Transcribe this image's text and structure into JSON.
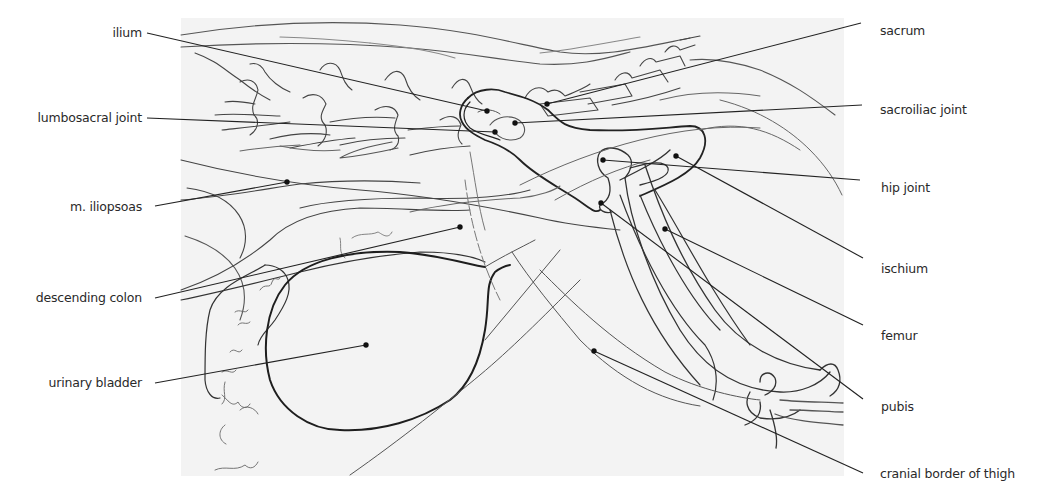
{
  "figure": {
    "background_panel_color": "#f3f3f3",
    "line_color": "#2b2b2b",
    "faint_line_color": "#6a6a6a"
  },
  "labels": {
    "left": [
      {
        "id": "ilium",
        "text": "ilium"
      },
      {
        "id": "lumbosacral-joint",
        "text": "lumbosacral joint"
      },
      {
        "id": "m-iliopsoas",
        "text": "m. iliopsoas"
      },
      {
        "id": "descending-colon",
        "text": "descending colon"
      },
      {
        "id": "urinary-bladder",
        "text": "urinary bladder"
      }
    ],
    "right": [
      {
        "id": "sacrum",
        "text": "sacrum"
      },
      {
        "id": "sacroiliac-joint",
        "text": "sacroiliac joint"
      },
      {
        "id": "hip-joint",
        "text": "hip joint"
      },
      {
        "id": "ischium",
        "text": "ischium"
      },
      {
        "id": "femur",
        "text": "femur"
      },
      {
        "id": "pubis",
        "text": "pubis"
      },
      {
        "id": "cranial-border-of-thigh",
        "text": "cranial border of thigh"
      }
    ]
  }
}
